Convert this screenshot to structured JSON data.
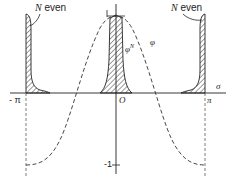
{
  "figure": {
    "type": "function-plot-diagram",
    "axes": {
      "x_label": "σ",
      "origin_label": "O",
      "x_ticks": [
        {
          "label": "- π",
          "value": "-pi"
        },
        {
          "label": "π",
          "value": "pi"
        }
      ],
      "y_ticks": [
        {
          "label": "1",
          "value": 1
        },
        {
          "label": "-1",
          "value": -1
        }
      ]
    },
    "curves": [
      {
        "name": "φ",
        "style": "dashed",
        "description": "cosine-like curve, max 1 at O, min -1 at ±π"
      },
      {
        "name": "φ^N",
        "style": "solid-hatched",
        "description": "sharp peaks at -π, 0, π (hatched area)"
      }
    ],
    "annotations": [
      {
        "text": "N even",
        "target": "left peak at -π"
      },
      {
        "text": "N even",
        "target": "right peak at π"
      },
      {
        "text": "φ",
        "target": "dashed curve"
      },
      {
        "text": "φ",
        "superscript": "N",
        "target": "central hatched peak"
      }
    ]
  },
  "labels": {
    "n_even_left_N": "N",
    "n_even_left_rest": " even",
    "n_even_right_N": "N",
    "n_even_right_rest": " even",
    "phi": "φ",
    "phiN_base": "φ",
    "phiN_sup": "N",
    "sigma": "σ",
    "minus_pi": "- π",
    "pi": "π",
    "origin": "O",
    "one": "1",
    "minus_one": "-1"
  },
  "colors": {
    "ink": "#222222",
    "background": "#ffffff"
  }
}
